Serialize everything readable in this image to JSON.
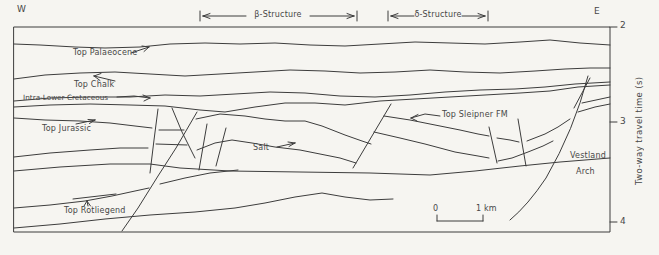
{
  "figure": {
    "orientation": {
      "west": "W",
      "east": "E"
    },
    "structures": {
      "beta": "β-Structure",
      "delta": "δ-Structure"
    },
    "labels": {
      "top_palaeocene": "Top Palaeocene",
      "top_chalk": "Top Chalk",
      "intra_lower_cretaceous": "Intra-Lower Cretaceous",
      "top_jurassic": "Top Jurassic",
      "salt": "Salt",
      "top_sleipner_fm": "Top Sleipner FM",
      "top_rotliegend": "Top Rotliegend",
      "vestland_arch_line1": "Vestland",
      "vestland_arch_line2": "Arch"
    },
    "scale_bar": {
      "start": "0",
      "end": "1 km"
    },
    "axis": {
      "title": "Two-way travel time (s)",
      "tick_2": "2",
      "tick_3": "3",
      "tick_4": "4"
    },
    "colors": {
      "line": "#3d3d3d",
      "background": "#f6f5f1",
      "text": "#474747"
    }
  }
}
